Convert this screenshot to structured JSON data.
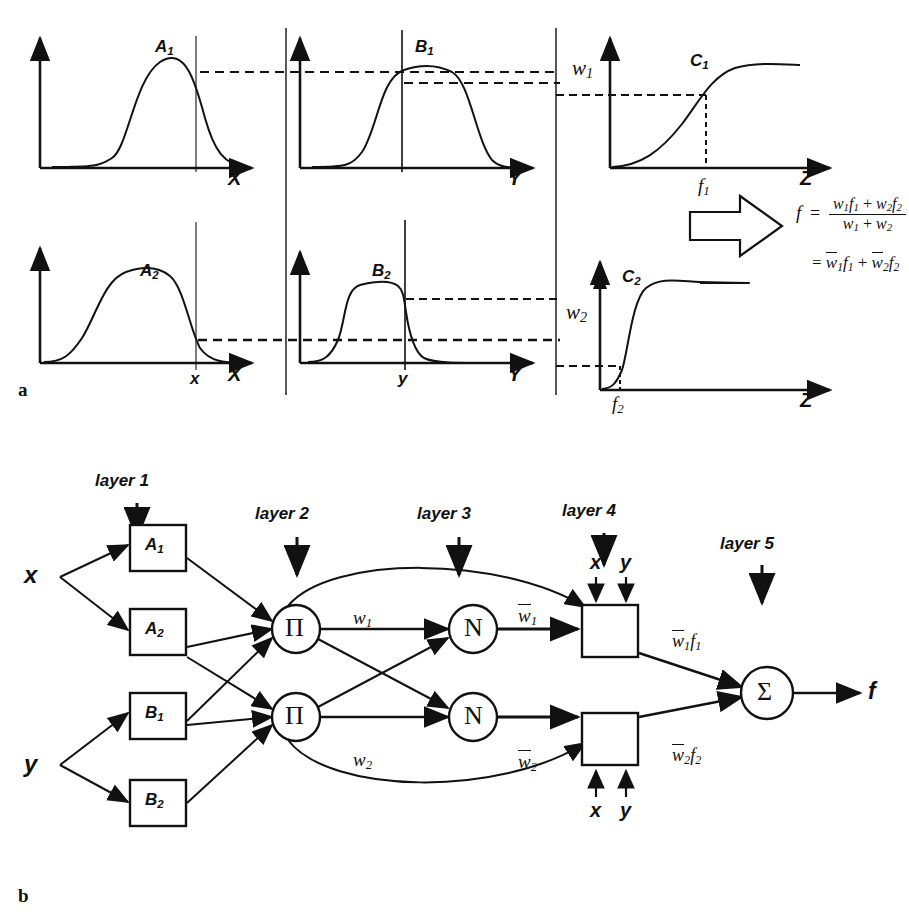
{
  "figure": {
    "panel_a_tag": "a",
    "panel_b_tag": "b",
    "top_clipped_text": ""
  },
  "panel_a": {
    "rows": [
      {
        "id": "row-1",
        "plots": [
          {
            "curve_label": "A",
            "curve_sub": "1",
            "axis_label": "X",
            "type": "bell"
          },
          {
            "curve_label": "B",
            "curve_sub": "1",
            "axis_label": "Y",
            "type": "bell-flat"
          },
          {
            "curve_label": "C",
            "curve_sub": "1",
            "axis_label": "Z",
            "type": "sigmoid-soft",
            "y_tick": "w",
            "y_tick_sub": "1",
            "x_tick": "f",
            "x_tick_sub": "1"
          }
        ]
      },
      {
        "id": "row-2",
        "plots": [
          {
            "curve_label": "A",
            "curve_sub": "2",
            "axis_label": "X",
            "type": "bell-wide",
            "x_tick": "x"
          },
          {
            "curve_label": "B",
            "curve_sub": "2",
            "axis_label": "Y",
            "type": "trapezoid",
            "x_tick": "y"
          },
          {
            "curve_label": "C",
            "curve_sub": "2",
            "axis_label": "Z",
            "type": "sigmoid-sharp",
            "y_tick": "w",
            "y_tick_sub": "2",
            "x_tick": "f",
            "x_tick_sub": "2"
          }
        ]
      }
    ],
    "formula": {
      "lhs": "f",
      "equals": "=",
      "numerator": "w₁f₁ + w₂f₂",
      "denominator": "w₁ + w₂",
      "second_line": "= w̄₁f₁ + w̄₂f₂",
      "num_parts": [
        {
          "base": "w",
          "sub": "1"
        },
        {
          "base": "f",
          "sub": "1"
        },
        {
          "op": "+"
        },
        {
          "base": "w",
          "sub": "2"
        },
        {
          "base": "f",
          "sub": "2"
        }
      ],
      "den_parts": [
        {
          "base": "w",
          "sub": "1"
        },
        {
          "op": "+"
        },
        {
          "base": "w",
          "sub": "2"
        }
      ],
      "line2_parts": [
        {
          "op": "="
        },
        {
          "base": "w",
          "sub": "1",
          "bar": true
        },
        {
          "base": "f",
          "sub": "1"
        },
        {
          "op": "+"
        },
        {
          "base": "w",
          "sub": "2",
          "bar": true
        },
        {
          "base": "f",
          "sub": "2"
        }
      ]
    }
  },
  "panel_b": {
    "layers": [
      {
        "label": "layer 1"
      },
      {
        "label": "layer 2"
      },
      {
        "label": "layer 3"
      },
      {
        "label": "layer 4"
      },
      {
        "label": "layer 5"
      }
    ],
    "inputs": [
      {
        "label": "x"
      },
      {
        "label": "y"
      }
    ],
    "membership_nodes": [
      {
        "label": "A",
        "sub": "1"
      },
      {
        "label": "A",
        "sub": "2"
      },
      {
        "label": "B",
        "sub": "1"
      },
      {
        "label": "B",
        "sub": "2"
      }
    ],
    "rule_nodes": [
      {
        "glyph": "Π",
        "name": "product-node-1"
      },
      {
        "glyph": "Π",
        "name": "product-node-2"
      }
    ],
    "norm_nodes": [
      {
        "glyph": "N",
        "name": "normalize-node-1"
      },
      {
        "glyph": "N",
        "name": "normalize-node-2"
      }
    ],
    "sum_node": {
      "glyph": "Σ",
      "name": "sum-node"
    },
    "edge_labels": {
      "w1": {
        "base": "w",
        "sub": "1",
        "bar": false
      },
      "w2": {
        "base": "w",
        "sub": "2",
        "bar": false
      },
      "wbar1": {
        "base": "w",
        "sub": "1",
        "bar": true
      },
      "wbar2": {
        "base": "w",
        "sub": "2",
        "bar": true
      },
      "wbar1f1": [
        {
          "base": "w",
          "sub": "1",
          "bar": true
        },
        {
          "base": "f",
          "sub": "1"
        }
      ],
      "wbar2f2": [
        {
          "base": "w",
          "sub": "2",
          "bar": true
        },
        {
          "base": "f",
          "sub": "2"
        }
      ]
    },
    "consequent_inputs_top": [
      {
        "label": "x"
      },
      {
        "label": "y"
      }
    ],
    "consequent_inputs_bottom": [
      {
        "label": "x"
      },
      {
        "label": "y"
      }
    ],
    "output": {
      "label": "f"
    }
  },
  "colors": {
    "ink": "#111111",
    "background": "#ffffff"
  }
}
